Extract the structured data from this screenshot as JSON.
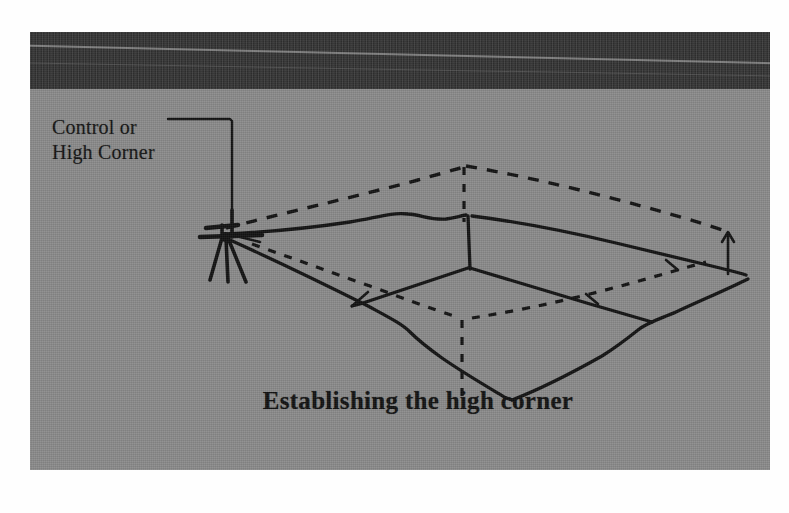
{
  "figure": {
    "kind": "scanned-textbook-illustration",
    "caption": "Establishing the high corner",
    "callout": {
      "line1": "Control or",
      "line2": "High Corner"
    },
    "colors": {
      "page_background": "#fefefe",
      "scan_background": "#8b8b8b",
      "header_band": "#2f2f2f",
      "ink": "#131313"
    },
    "elements": {
      "tripod": "surveying-tripod-with-level-instrument",
      "pit": "rectangular-excavation-pit-in-perspective",
      "dashed_lines": "original-ground-surface-and-hidden-edges",
      "solid_lines": "excavated-pit-edges",
      "arrow": "depth-indicator-arrow-right-side"
    }
  }
}
